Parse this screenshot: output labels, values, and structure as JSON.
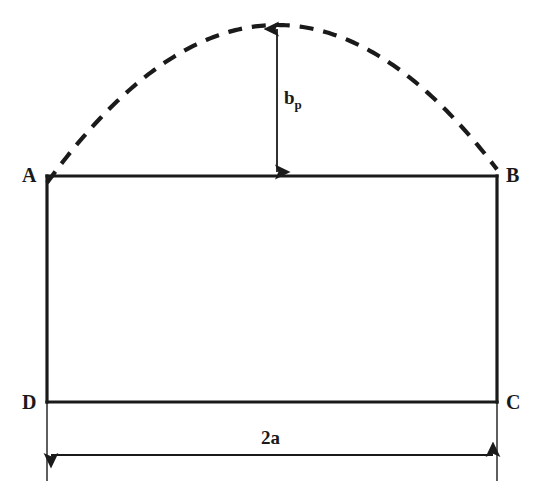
{
  "diagram": {
    "type": "engineering-geometry-diagram",
    "background_color": "#ffffff",
    "stroke_color": "#1a1a1a",
    "vertices": [
      {
        "id": "A",
        "label": "A",
        "x": 47,
        "y": 176
      },
      {
        "id": "B",
        "label": "B",
        "x": 497,
        "y": 176
      },
      {
        "id": "C",
        "label": "C",
        "x": 497,
        "y": 402
      },
      {
        "id": "D",
        "label": "D",
        "x": 47,
        "y": 402
      }
    ],
    "rectangle": {
      "left": 47,
      "right": 497,
      "top": 176,
      "bottom": 402,
      "width": 450,
      "height": 226,
      "stroke_width": 3.2
    },
    "arc": {
      "style": "dashed",
      "start_x": 47,
      "start_y": 176,
      "end_x": 497,
      "end_y": 176,
      "apex_x": 277,
      "apex_y": 25,
      "rise": 151,
      "stroke_width": 4.2,
      "dash_length": 14,
      "dash_gap": 10
    },
    "dimensions": [
      {
        "id": "rise",
        "label": "b",
        "subscript": "p",
        "orientation": "vertical",
        "x": 277,
        "from_y": 25,
        "to_y": 176,
        "arrowheads": "both",
        "stroke_width": 1.8
      },
      {
        "id": "base-width",
        "label": "2a",
        "orientation": "horizontal",
        "y": 455,
        "from_x": 47,
        "to_x": 497,
        "arrowheads": "both",
        "stroke_width": 1.8
      }
    ],
    "extension_lines": [
      {
        "id": "left-extension",
        "x": 47,
        "from_y": 402,
        "to_y": 481,
        "stroke_width": 1.4
      },
      {
        "id": "right-extension",
        "x": 497,
        "from_y": 402,
        "to_y": 481,
        "stroke_width": 1.4
      }
    ]
  }
}
